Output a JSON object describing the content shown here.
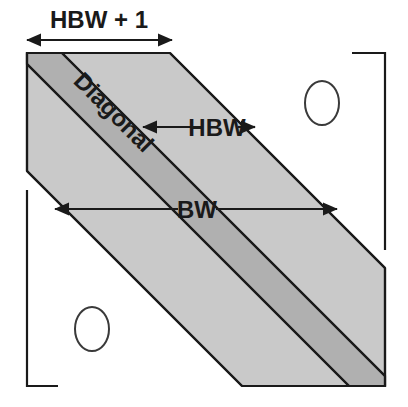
{
  "figure": {
    "labels": {
      "hbw_plus_one": "HBW + 1",
      "hbw": "HBW",
      "bw": "BW",
      "diagonal": "Diagonal"
    },
    "zero_markers": [
      {
        "name": "upper-right-zero",
        "glyph": "0"
      },
      {
        "name": "lower-left-zero",
        "glyph": "0"
      }
    ],
    "colors": {
      "outer_band_fill": "#c9c9c9",
      "diagonal_band_fill": "#b0b0b0",
      "outline": "#1a1a1a",
      "background": "#ffffff",
      "text": "#1a1a1a"
    },
    "geometry": {
      "matrix_left": 27,
      "matrix_right": 385,
      "matrix_top": 53,
      "matrix_bottom": 386,
      "bandwidth_px": 143,
      "half_bandwidth_px": 110
    },
    "dimension_arrows": [
      {
        "name": "hbw-plus-one-arrow",
        "x1": 27,
        "x2": 172,
        "y": 40,
        "double_headed": true
      },
      {
        "name": "hbw-arrow",
        "x1": 143,
        "x2": 253,
        "y": 127,
        "double_headed": true
      },
      {
        "name": "bw-arrow",
        "x1": 55,
        "x2": 336,
        "y": 209,
        "double_headed": true
      }
    ]
  }
}
